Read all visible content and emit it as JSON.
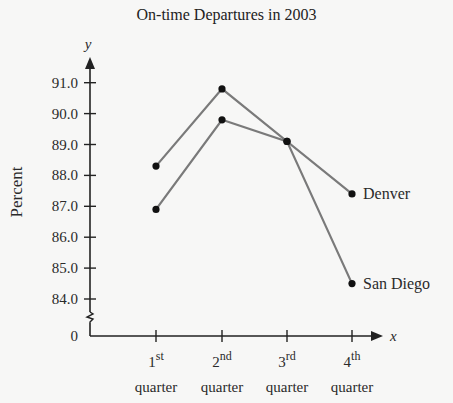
{
  "chart_data": {
    "type": "line",
    "title": "On-time Departures in 2003",
    "xlabel": "x",
    "ylabel": "Percent",
    "y_axis_var": "y",
    "categories": [
      "1st quarter",
      "2nd quarter",
      "3rd quarter",
      "4th quarter"
    ],
    "category_labels": [
      {
        "num": "1",
        "sup": "st",
        "word": "quarter"
      },
      {
        "num": "2",
        "sup": "nd",
        "word": "quarter"
      },
      {
        "num": "3",
        "sup": "rd",
        "word": "quarter"
      },
      {
        "num": "4",
        "sup": "th",
        "word": "quarter"
      }
    ],
    "y_ticks": [
      "0",
      "84.0",
      "85.0",
      "86.0",
      "87.0",
      "88.0",
      "89.0",
      "90.0",
      "91.0"
    ],
    "ylim": [
      84.0,
      91.0
    ],
    "axis_break": true,
    "grid": false,
    "legend": "direct labels at line ends",
    "series": [
      {
        "name": "Denver",
        "values": [
          86.9,
          89.8,
          89.1,
          87.4
        ]
      },
      {
        "name": "San Diego",
        "values": [
          88.3,
          90.8,
          89.1,
          84.5
        ]
      }
    ],
    "colors": {
      "line": "#7a7a7a",
      "marker": "#111111",
      "axis": "#222222"
    }
  }
}
